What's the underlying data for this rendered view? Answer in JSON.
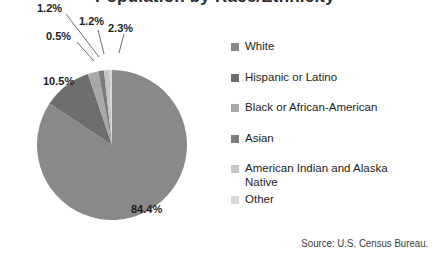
{
  "title": {
    "text": "Population by Race/Ethnicity",
    "cropped": true
  },
  "chart_data": {
    "type": "pie",
    "title": "Population by Race/Ethnicity",
    "categories": [
      "White",
      "Hispanic or Latino",
      "Black or African-American",
      "Asian",
      "American Indian and Alaska Native",
      "Other"
    ],
    "values": [
      84.4,
      10.5,
      2.3,
      1.2,
      1.2,
      0.5
    ],
    "value_labels": [
      "84.4%",
      "10.5%",
      "2.3%",
      "1.2%",
      "1.2%",
      "0.5%"
    ],
    "colors": [
      "#898989",
      "#6e6e6e",
      "#a8a8a8",
      "#7b7b7b",
      "#c4c4c4",
      "#d8d8d8"
    ],
    "units": "percent",
    "legend_position": "right",
    "grid": false,
    "annotations": [
      "Source: U.S. Census Bureau."
    ]
  },
  "legend": {
    "items": [
      {
        "label": "White",
        "color": "#898989",
        "swatch": "legend-swatch-white"
      },
      {
        "label": "Hispanic or Latino",
        "color": "#6e6e6e",
        "swatch": "legend-swatch-hispanic"
      },
      {
        "label": "Black or African-American",
        "color": "#a8a8a8",
        "swatch": "legend-swatch-black"
      },
      {
        "label": "Asian",
        "color": "#7b7b7b",
        "swatch": "legend-swatch-asian"
      },
      {
        "label": "American Indian and Alaska\nNative",
        "color": "#c4c4c4",
        "swatch": "legend-swatch-native"
      },
      {
        "label": "Other",
        "color": "#d8d8d8",
        "swatch": "legend-swatch-other"
      }
    ]
  },
  "callouts": {
    "a": "1.2%",
    "b": "1.2%",
    "c": "2.3%",
    "d": "0.5%",
    "big": "84.4%"
  },
  "source": {
    "text": "Source: U.S. Census Bureau."
  }
}
